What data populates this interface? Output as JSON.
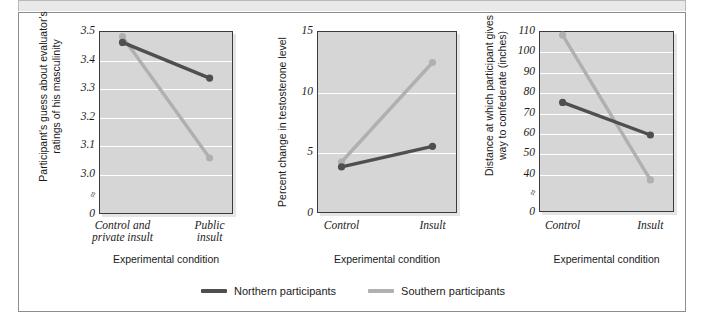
{
  "figure": {
    "background": "#ffffff",
    "frame_color": "#8c8c8c",
    "plot_bg": "#d6d6d6",
    "gridline_color": "#ffffff"
  },
  "legend": {
    "entries": [
      {
        "label": "Northern participants",
        "color": "#4f4f4f",
        "series_key": "northern"
      },
      {
        "label": "Southern participants",
        "color": "#b0b0b0",
        "series_key": "southern"
      }
    ]
  },
  "chart_data": [
    {
      "type": "line",
      "panel": 1,
      "title": "",
      "ylabel": "Participant's guess about evaluator's ratings of his masculinity",
      "xlabel": "Experimental condition",
      "categories": [
        "Control and private insult",
        "Public insult"
      ],
      "ytick_labels": [
        "3.5",
        "3.4",
        "3.3",
        "3.2",
        "3.1",
        "3.0",
        "0"
      ],
      "ytick_values": [
        3.5,
        3.4,
        3.3,
        3.2,
        3.1,
        3.0,
        0
      ],
      "ylim": [
        2.95,
        3.5
      ],
      "axis_break": true,
      "grid": true,
      "series": [
        {
          "name": "Northern participants",
          "color": "#4f4f4f",
          "values": [
            3.46,
            3.335
          ]
        },
        {
          "name": "Southern participants",
          "color": "#b0b0b0",
          "values": [
            3.48,
            3.055
          ]
        }
      ]
    },
    {
      "type": "line",
      "panel": 2,
      "title": "",
      "ylabel": "Percent change in testosterone level",
      "xlabel": "Experimental condition",
      "categories": [
        "Control",
        "Insult"
      ],
      "ytick_labels": [
        "15",
        "10",
        "5",
        "0"
      ],
      "ytick_values": [
        15,
        10,
        5,
        0
      ],
      "ylim": [
        0,
        15
      ],
      "axis_break": false,
      "grid": true,
      "series": [
        {
          "name": "Northern participants",
          "color": "#4f4f4f",
          "values": [
            3.8,
            5.5
          ]
        },
        {
          "name": "Southern participants",
          "color": "#b0b0b0",
          "values": [
            4.2,
            12.4
          ]
        }
      ]
    },
    {
      "type": "line",
      "panel": 3,
      "title": "",
      "ylabel": "Distance at which participant gives way to confederate (inches)",
      "xlabel": "Experimental condition",
      "categories": [
        "Control",
        "Insult"
      ],
      "ytick_labels": [
        "110",
        "100",
        "90",
        "80",
        "70",
        "60",
        "50",
        "40",
        "0"
      ],
      "ytick_values": [
        110,
        100,
        90,
        80,
        70,
        60,
        50,
        40,
        0
      ],
      "ylim": [
        34,
        110
      ],
      "axis_break": true,
      "grid": true,
      "series": [
        {
          "name": "Northern participants",
          "color": "#4f4f4f",
          "values": [
            75,
            59
          ]
        },
        {
          "name": "Southern participants",
          "color": "#b0b0b0",
          "values": [
            108,
            37
          ]
        }
      ]
    }
  ]
}
